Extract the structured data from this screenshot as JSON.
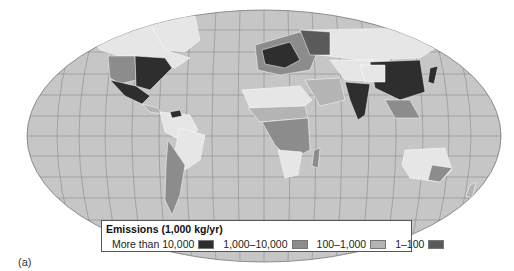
{
  "figure": {
    "panel_label": "(a)",
    "map_type": "world emissions choropleth"
  },
  "legend": {
    "title": "Emissions (1,000 kg/yr)",
    "items": [
      {
        "label": "More than 10,000",
        "color": "#2e2e2e"
      },
      {
        "label": "1,000–10,000",
        "color": "#8c8c8c"
      },
      {
        "label": "100–1,000",
        "color": "#b4b4b4"
      },
      {
        "label": "1–100",
        "color": "#5a5a5a"
      }
    ]
  },
  "colors": {
    "ocean": "#c6c6c6",
    "graticule": "#8a8a8a",
    "land_none": "#e6e6e6",
    "border": "#ffffff"
  }
}
